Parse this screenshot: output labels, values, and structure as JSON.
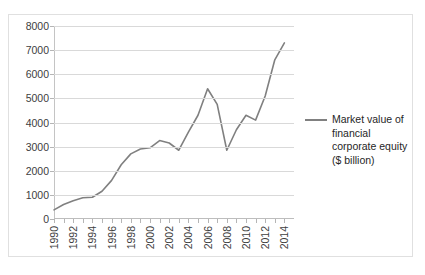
{
  "chart_data": {
    "type": "line",
    "title": "",
    "xlabel": "",
    "ylabel": "",
    "xlim": [
      1990,
      2015
    ],
    "ylim": [
      0,
      8000
    ],
    "grid": true,
    "legend_position": "right",
    "y_ticks": [
      8000,
      7000,
      6000,
      5000,
      4000,
      3000,
      2000,
      1000,
      0
    ],
    "x_ticks": [
      1990,
      1992,
      1994,
      1996,
      1998,
      2000,
      2002,
      2004,
      2006,
      2008,
      2010,
      2012,
      2014
    ],
    "x": [
      1990,
      1991,
      1992,
      1993,
      1994,
      1995,
      1996,
      1997,
      1998,
      1999,
      2000,
      2001,
      2002,
      2003,
      2004,
      2005,
      2006,
      2007,
      2008,
      2009,
      2010,
      2011,
      2012,
      2013,
      2014
    ],
    "series": [
      {
        "name": "Market value of financial corporate equity ($ billion)",
        "color": "#808080",
        "values": [
          380,
          600,
          760,
          880,
          900,
          1150,
          1600,
          2250,
          2700,
          2900,
          2950,
          3250,
          3150,
          2850,
          3600,
          4300,
          5400,
          4750,
          2850,
          3700,
          4300,
          4100,
          5100,
          6600,
          7300
        ]
      }
    ]
  },
  "legend": {
    "entries": [
      {
        "label": "Market value of financial corporate equity ($ billion)",
        "color": "#808080"
      }
    ]
  }
}
